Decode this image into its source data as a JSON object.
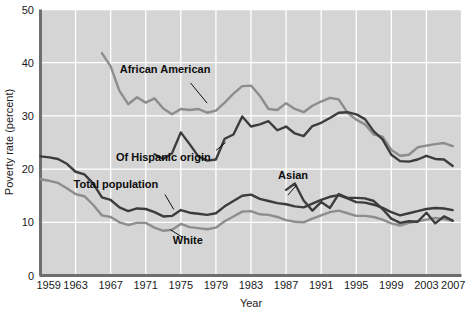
{
  "chart_data": {
    "type": "line",
    "title": "",
    "xlabel": "Year",
    "ylabel": "Poverty rate (percent)",
    "xlim": [
      1959,
      2007
    ],
    "ylim": [
      0,
      50
    ],
    "grid": true,
    "legend": "inline-annotations",
    "plot_background": "#d5d5d5",
    "grid_color": "#ffffff",
    "xticks": [
      "1959",
      "1963",
      "1967",
      "1971",
      "1975",
      "1979",
      "1983",
      "1987",
      "1991",
      "1995",
      "1999",
      "2003",
      "2007"
    ],
    "yticks": [
      "0",
      "10",
      "20",
      "30",
      "40",
      "50"
    ],
    "series": [
      {
        "name": "African American",
        "color": "#8d8d8d",
        "label_x": 1973.2,
        "label_y": 38.0,
        "leader": {
          "x1": 1976.1,
          "y1": 36.2,
          "x2": 1978.0,
          "y2": 32.4
        },
        "x": [
          1966,
          1967,
          1968,
          1969,
          1970,
          1971,
          1972,
          1973,
          1974,
          1975,
          1976,
          1977,
          1978,
          1979,
          1980,
          1981,
          1982,
          1983,
          1984,
          1985,
          1986,
          1987,
          1988,
          1989,
          1990,
          1991,
          1992,
          1993,
          1994,
          1995,
          1996,
          1997,
          1998,
          1999,
          2000,
          2001,
          2002,
          2003,
          2004,
          2005,
          2006
        ],
        "values": [
          41.8,
          39.3,
          34.7,
          32.2,
          33.5,
          32.5,
          33.3,
          31.4,
          30.3,
          31.3,
          31.1,
          31.3,
          30.6,
          31.0,
          32.5,
          34.2,
          35.6,
          35.7,
          33.8,
          31.3,
          31.1,
          32.4,
          31.3,
          30.7,
          31.9,
          32.7,
          33.4,
          33.1,
          30.6,
          29.3,
          28.4,
          26.5,
          26.1,
          23.6,
          22.5,
          22.7,
          24.1,
          24.4,
          24.7,
          24.9,
          24.3
        ]
      },
      {
        "name": "Of Hispanic origin",
        "color": "#3c3c3c",
        "label_x": 1973.0,
        "label_y": 21.6,
        "leader": {
          "x1": 1979.0,
          "y1": 23.5,
          "x2": 1980.1,
          "y2": 25.0
        },
        "x": [
          1972,
          1973,
          1974,
          1975,
          1976,
          1977,
          1978,
          1979,
          1980,
          1981,
          1982,
          1983,
          1984,
          1985,
          1986,
          1987,
          1988,
          1989,
          1990,
          1991,
          1992,
          1993,
          1994,
          1995,
          1996,
          1997,
          1998,
          1999,
          2000,
          2001,
          2002,
          2003,
          2004,
          2005,
          2006
        ],
        "values": [
          22.8,
          21.9,
          23.0,
          26.9,
          24.7,
          22.4,
          21.6,
          21.8,
          25.7,
          26.5,
          29.9,
          28.0,
          28.4,
          29.0,
          27.3,
          28.0,
          26.7,
          26.2,
          28.1,
          28.7,
          29.6,
          30.6,
          30.7,
          30.3,
          29.4,
          27.1,
          25.6,
          22.7,
          21.5,
          21.4,
          21.8,
          22.5,
          21.9,
          21.8,
          20.6
        ]
      },
      {
        "name": "Total population",
        "color": "#3c3c3c",
        "label_x": 1967.6,
        "label_y": 16.4,
        "leader": {
          "x1": 1973.2,
          "y1": 15.2,
          "x2": 1974.2,
          "y2": 12.4
        },
        "x": [
          1959,
          1960,
          1961,
          1962,
          1963,
          1964,
          1965,
          1966,
          1967,
          1968,
          1969,
          1970,
          1971,
          1972,
          1973,
          1974,
          1975,
          1976,
          1977,
          1978,
          1979,
          1980,
          1981,
          1982,
          1983,
          1984,
          1985,
          1986,
          1987,
          1988,
          1989,
          1990,
          1991,
          1992,
          1993,
          1994,
          1995,
          1996,
          1997,
          1998,
          1999,
          2000,
          2001,
          2002,
          2003,
          2004,
          2005,
          2006
        ],
        "values": [
          22.4,
          22.2,
          21.9,
          21.0,
          19.5,
          19.0,
          17.3,
          14.7,
          14.2,
          12.8,
          12.1,
          12.6,
          12.5,
          11.9,
          11.1,
          11.2,
          12.3,
          11.8,
          11.6,
          11.4,
          11.7,
          13.0,
          14.0,
          15.0,
          15.2,
          14.4,
          14.0,
          13.6,
          13.4,
          13.0,
          12.8,
          13.5,
          14.2,
          14.8,
          15.1,
          14.5,
          13.8,
          13.7,
          13.3,
          12.7,
          11.9,
          11.3,
          11.7,
          12.1,
          12.5,
          12.7,
          12.6,
          12.3
        ]
      },
      {
        "name": "White",
        "color": "#8d8d8d",
        "label_x": 1975.8,
        "label_y": 6.0,
        "leader": {
          "x1": 1975.2,
          "y1": 7.2,
          "x2": 1973.8,
          "y2": 8.6
        },
        "x": [
          1959,
          1960,
          1961,
          1962,
          1963,
          1964,
          1965,
          1966,
          1967,
          1968,
          1969,
          1970,
          1971,
          1972,
          1973,
          1974,
          1975,
          1976,
          1977,
          1978,
          1979,
          1980,
          1981,
          1982,
          1983,
          1984,
          1985,
          1986,
          1987,
          1988,
          1989,
          1990,
          1991,
          1992,
          1993,
          1994,
          1995,
          1996,
          1997,
          1998,
          1999,
          2000,
          2001,
          2002,
          2003,
          2004,
          2005,
          2006
        ],
        "values": [
          18.1,
          17.8,
          17.4,
          16.4,
          15.3,
          14.9,
          13.3,
          11.3,
          11.0,
          10.0,
          9.5,
          9.9,
          9.9,
          9.0,
          8.4,
          8.6,
          9.7,
          9.1,
          8.9,
          8.7,
          9.0,
          10.2,
          11.1,
          12.0,
          12.1,
          11.5,
          11.4,
          11.0,
          10.4,
          10.1,
          10.0,
          10.7,
          11.3,
          11.9,
          12.2,
          11.7,
          11.2,
          11.2,
          11.0,
          10.5,
          9.8,
          9.4,
          9.9,
          10.2,
          10.5,
          10.8,
          10.6,
          10.3
        ]
      },
      {
        "name": "Asian",
        "color": "#3c3c3c",
        "label_x": 1987.8,
        "label_y": 18.2,
        "leader": {
          "x1": 1988.2,
          "y1": 17.0,
          "x2": 1987.2,
          "y2": 15.1
        },
        "x": [
          1987,
          1988,
          1989,
          1990,
          1991,
          1992,
          1993,
          1994,
          1995,
          1996,
          1997,
          1998,
          1999,
          2000,
          2001,
          2002,
          2003,
          2004,
          2005,
          2006
        ],
        "values": [
          16.1,
          17.3,
          14.1,
          12.2,
          13.8,
          12.7,
          15.3,
          14.6,
          14.6,
          14.5,
          14.0,
          12.5,
          10.7,
          9.9,
          10.2,
          10.1,
          11.8,
          9.8,
          11.1,
          10.3
        ]
      }
    ]
  }
}
